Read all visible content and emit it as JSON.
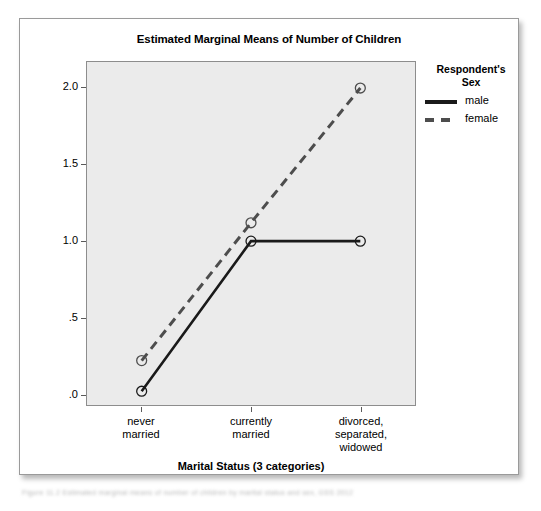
{
  "chart_data": {
    "type": "line",
    "title": "Estimated Marginal Means of Number of Children",
    "xlabel": "Marital Status (3 categories)",
    "ylabel": "Estimated Marginal Means",
    "categories": [
      "never married",
      "currently married",
      "divorced, separated, widowed"
    ],
    "category_lines": [
      [
        "never",
        "married"
      ],
      [
        "currently",
        "married"
      ],
      [
        "divorced,",
        "separated,",
        "widowed"
      ]
    ],
    "series": [
      {
        "name": "male",
        "values": [
          0.02,
          1.0,
          1.0
        ],
        "style": "solid",
        "color": "#1a1a1a"
      },
      {
        "name": "female",
        "values": [
          0.22,
          1.12,
          2.0
        ],
        "style": "dashed",
        "color": "#4d4d4d"
      }
    ],
    "ylim": [
      -0.07,
      2.17
    ],
    "yticks": [
      2.0,
      1.5,
      1.0,
      0.5,
      0.0
    ],
    "ytick_labels": [
      "2.0",
      "1.5",
      "1.0",
      ".5",
      ".0"
    ],
    "grid": false,
    "legend_position": "right",
    "legend_title_lines": [
      "Respondent's",
      "Sex"
    ],
    "marker": "open-circle",
    "plot_background": "#ebebeb"
  },
  "legend": {
    "title_line1": "Respondent's",
    "title_line2": "Sex",
    "entries": [
      {
        "label": "male"
      },
      {
        "label": "female"
      }
    ]
  },
  "caption": {
    "text": "Figure 11.2  Estimated marginal means of number of children by marital status and sex, GSS 2012"
  }
}
